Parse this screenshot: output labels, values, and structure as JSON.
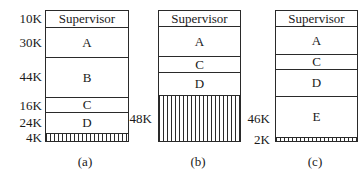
{
  "panels": [
    {
      "caption": "(a)",
      "segments": [
        {
          "name": "Supervisor",
          "size_label": "10K",
          "type": "allocated"
        },
        {
          "name": "A",
          "size_label": "30K",
          "type": "allocated"
        },
        {
          "name": "B",
          "size_label": "44K",
          "type": "allocated"
        },
        {
          "name": "C",
          "size_label": "16K",
          "type": "allocated"
        },
        {
          "name": "D",
          "size_label": "24K",
          "type": "allocated"
        },
        {
          "name": "",
          "size_label": "4K",
          "type": "free"
        }
      ]
    },
    {
      "caption": "(b)",
      "segments": [
        {
          "name": "Supervisor",
          "size_label": "",
          "type": "allocated"
        },
        {
          "name": "A",
          "size_label": "",
          "type": "allocated"
        },
        {
          "name": "C",
          "size_label": "",
          "type": "allocated"
        },
        {
          "name": "D",
          "size_label": "",
          "type": "allocated"
        },
        {
          "name": "",
          "size_label": "48K",
          "type": "free"
        }
      ]
    },
    {
      "caption": "(c)",
      "segments": [
        {
          "name": "Supervisor",
          "size_label": "",
          "type": "allocated"
        },
        {
          "name": "A",
          "size_label": "",
          "type": "allocated"
        },
        {
          "name": "C",
          "size_label": "",
          "type": "allocated"
        },
        {
          "name": "D",
          "size_label": "",
          "type": "allocated"
        },
        {
          "name": "E",
          "size_label": "46K",
          "type": "allocated"
        },
        {
          "name": "",
          "size_label": "2K",
          "type": "free"
        }
      ]
    }
  ]
}
